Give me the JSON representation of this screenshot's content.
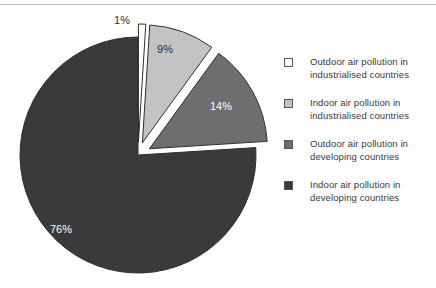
{
  "canvas": {
    "width": 436,
    "height": 288,
    "background": "#ffffff",
    "top_rule_color": "#bfbfbf"
  },
  "chart_data": {
    "type": "pie",
    "title": "",
    "subtitle": "",
    "xlabel": "",
    "ylabel": "",
    "grid": false,
    "legend_position": "right",
    "exploded": true,
    "categories": [
      "Outdoor air pollution in industrialised countries",
      "Indoor air pollution in industrialised countries",
      "Outdoor air pollution in developing countries",
      "Indoor air pollution in developing countries"
    ],
    "values": [
      1,
      9,
      14,
      76
    ],
    "data_labels": [
      "1%",
      "9%",
      "14%",
      "76%"
    ],
    "colors": [
      "#ffffff",
      "#c3c3c3",
      "#6e6e6e",
      "#3a3a3a"
    ],
    "label_colors": [
      "#2b2b2b",
      "#2b2b2b",
      "#ffffff",
      "#ffffff"
    ],
    "units": "percent",
    "total": 100
  },
  "pie": {
    "center_x": 138,
    "center_y": 155,
    "radius": 118,
    "start_angle_deg": -90,
    "slices": [
      {
        "id": "slice-outdoor-industrialised",
        "label": "1%",
        "value": 1,
        "fill": "#ffffff",
        "text_fill": "#2b2b2b",
        "explode": 13,
        "label_x": 122,
        "label_y": 24
      },
      {
        "id": "slice-indoor-industrialised",
        "label": "9%",
        "value": 9,
        "fill": "#c3c3c3",
        "text_fill": "#2b2b2b",
        "explode": 13,
        "label_x": 165,
        "label_y": 53
      },
      {
        "id": "slice-outdoor-developing",
        "label": "14%",
        "value": 14,
        "fill": "#6e6e6e",
        "text_fill": "#ffffff",
        "explode": 13,
        "label_x": 221,
        "label_y": 110
      },
      {
        "id": "slice-indoor-developing",
        "label": "76%",
        "value": 76,
        "fill": "#3a3a3a",
        "text_fill": "#ffffff",
        "explode": 0,
        "label_x": 61,
        "label_y": 233
      }
    ]
  },
  "legend": {
    "items": [
      {
        "swatch": "#ffffff",
        "line1": "Outdoor air pollution in",
        "line2": "industrialised countries"
      },
      {
        "swatch": "#c3c3c3",
        "line1": "Indoor air pollution in",
        "line2": "industrialised countries"
      },
      {
        "swatch": "#6e6e6e",
        "line1": "Outdoor air pollution in",
        "line2": "developing countries"
      },
      {
        "swatch": "#3a3a3a",
        "line1": "Indoor air pollution in",
        "line2": "developing countries"
      }
    ]
  }
}
